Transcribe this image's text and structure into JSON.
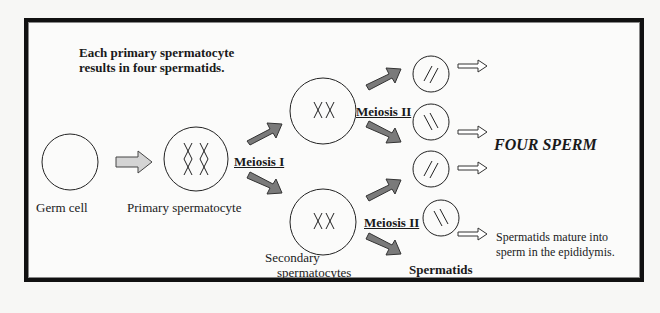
{
  "title": {
    "line1": "Each primary spermatocyte",
    "line2": "results in four spermatids."
  },
  "labels": {
    "germ_cell": "Germ cell",
    "primary": "Primary spermatocyte",
    "meiosis1": "Meiosis I",
    "meiosis2_top": "Meiosis II",
    "meiosis2_bottom": "Meiosis II",
    "secondary_line1": "Secondary",
    "secondary_line2": "spermatocytes",
    "spermatids": "Spermatids",
    "four_sperm": "FOUR SPERM",
    "mature_line1": "Spermatids mature into",
    "mature_line2": "sperm in the epididymis."
  },
  "colors": {
    "arrow_fill": "#7a7a7a",
    "light_arrow": "#cfcfcf",
    "frame": "#111111"
  }
}
